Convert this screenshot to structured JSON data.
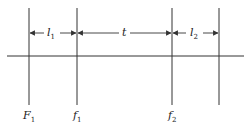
{
  "diagram": {
    "type": "optical-lens-layout",
    "line_color": "#333333",
    "spans": [
      {
        "id": "l1",
        "symbol": "l",
        "subscript": "1"
      },
      {
        "id": "t",
        "symbol": "t",
        "subscript": ""
      },
      {
        "id": "l2",
        "symbol": "l",
        "subscript": "2"
      }
    ],
    "planes": [
      {
        "id": "F1",
        "symbol": "F",
        "subscript": "1"
      },
      {
        "id": "f1",
        "symbol": "f",
        "subscript": "1"
      },
      {
        "id": "f2",
        "symbol": "f",
        "subscript": "2"
      },
      {
        "id": "p4",
        "symbol": "",
        "subscript": ""
      }
    ]
  }
}
